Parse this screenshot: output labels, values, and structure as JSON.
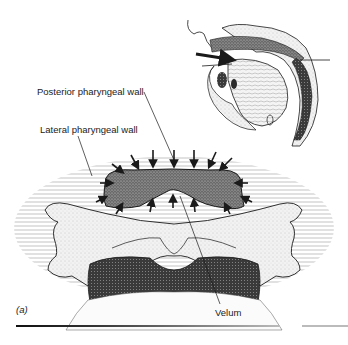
{
  "figure": {
    "panel_label": "(a)",
    "labels": {
      "posterior_pharyngeal_wall": "Posterior pharyngeal wall",
      "lateral_pharyngeal_wall": "Lateral pharyngeal wall",
      "velum": "Velum"
    },
    "colors": {
      "ink": "#1a1a1a",
      "stipple_dark": "#4a4a4a",
      "stipple_mid": "#8a8a8a",
      "stipple_light": "#cfcfcf",
      "background": "#ffffff"
    }
  }
}
